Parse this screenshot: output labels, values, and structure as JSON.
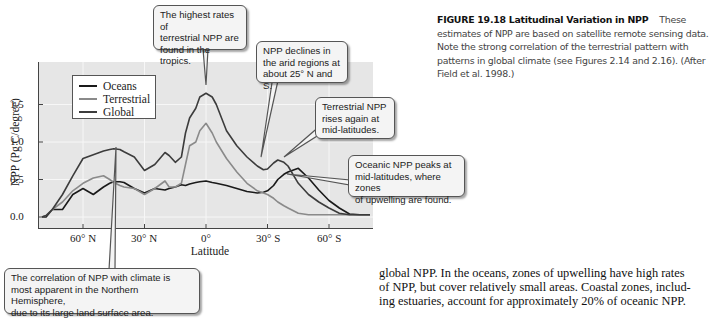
{
  "chart_data": {
    "type": "line",
    "title": "",
    "xlabel": "Latitude",
    "ylabel": "NPP (Pg C/degree)",
    "ylim": [
      -0.2,
      1.95
    ],
    "xlim": [
      80,
      -80
    ],
    "grid": true,
    "legend_position": "upper-left",
    "x_tick_labels": [
      "60° N",
      "30° N",
      "0°",
      "30° S",
      "60° S"
    ],
    "x_tick_values": [
      60,
      30,
      0,
      -30,
      -60
    ],
    "y_tick_labels": [
      "0.0",
      "0.5",
      "1.0",
      "1.5"
    ],
    "y_tick_values": [
      0.0,
      0.5,
      1.0,
      1.5
    ],
    "x": [
      80,
      78,
      75,
      70,
      65,
      60,
      55,
      50,
      47,
      45,
      42,
      40,
      35,
      30,
      25,
      20,
      18,
      15,
      12,
      10,
      8,
      5,
      3,
      0,
      -3,
      -5,
      -10,
      -15,
      -20,
      -25,
      -28,
      -30,
      -33,
      -35,
      -38,
      -40,
      -45,
      -50,
      -55,
      -60,
      -65,
      -70,
      -75,
      -80
    ],
    "series": [
      {
        "name": "Oceans",
        "color": "#1a1a1a",
        "values": [
          0.0,
          0.0,
          0.1,
          0.1,
          0.3,
          0.38,
          0.3,
          0.4,
          0.45,
          0.47,
          0.47,
          0.46,
          0.38,
          0.32,
          0.38,
          0.36,
          0.38,
          0.4,
          0.43,
          0.42,
          0.44,
          0.46,
          0.47,
          0.48,
          0.46,
          0.45,
          0.42,
          0.38,
          0.34,
          0.32,
          0.33,
          0.35,
          0.42,
          0.5,
          0.57,
          0.6,
          0.65,
          0.52,
          0.36,
          0.22,
          0.12,
          0.04,
          0.03,
          0.03
        ]
      },
      {
        "name": "Terrestrial",
        "color": "#8a8a8a",
        "values": [
          0.0,
          0.02,
          0.1,
          0.2,
          0.35,
          0.45,
          0.52,
          0.55,
          0.5,
          0.46,
          0.42,
          0.4,
          0.38,
          0.3,
          0.38,
          0.48,
          0.4,
          0.4,
          0.45,
          0.7,
          0.95,
          1.0,
          1.15,
          1.25,
          1.12,
          1.0,
          0.78,
          0.6,
          0.45,
          0.35,
          0.32,
          0.3,
          0.25,
          0.2,
          0.15,
          0.12,
          0.05,
          0.03,
          0.03,
          0.03,
          0.03,
          0.03,
          0.03,
          0.03
        ]
      },
      {
        "name": "Global",
        "color": "#3c3c3c",
        "values": [
          0.0,
          0.02,
          0.1,
          0.3,
          0.55,
          0.78,
          0.83,
          0.88,
          0.9,
          0.91,
          0.9,
          0.87,
          0.8,
          0.62,
          0.7,
          0.86,
          0.82,
          0.73,
          0.8,
          1.12,
          1.32,
          1.45,
          1.6,
          1.65,
          1.6,
          1.5,
          1.15,
          0.95,
          0.8,
          0.68,
          0.63,
          0.64,
          0.72,
          0.76,
          0.73,
          0.68,
          0.45,
          0.3,
          0.2,
          0.12,
          0.05,
          0.03,
          0.03,
          0.03
        ]
      }
    ],
    "annotations": [
      "The highest rates of terrestrial NPP are found in the tropics.",
      "NPP declines in the arid regions at about 25° N and S.",
      "Terrestrial NPP rises again at mid-latitudes.",
      "Oceanic NPP peaks at mid-latitudes, where zones of upwelling are found.",
      "The correlation of NPP with climate is most apparent in the Northern Hemisphere, due to its large land surface area."
    ]
  },
  "legend": {
    "items": [
      {
        "label": "Oceans",
        "color": "#1a1a1a"
      },
      {
        "label": "Terrestrial",
        "color": "#8a8a8a"
      },
      {
        "label": "Global",
        "color": "#3c3c3c"
      }
    ]
  },
  "axes": {
    "ylabel": "NPP (Pg C/degree)",
    "xlabel": "Latitude",
    "y_ticks": [
      "0.0",
      "0.5",
      "1.0",
      "1.5"
    ],
    "x_ticks": [
      "60° N",
      "30° N",
      "0°",
      "30° S",
      "60° S"
    ]
  },
  "callouts": {
    "tropics": [
      "The highest rates of",
      "terrestrial NPP are",
      "found in the tropics."
    ],
    "arid": [
      "NPP declines in",
      "the arid regions at",
      "about 25° N and S."
    ],
    "midlat_terrestrial": [
      "Terrestrial NPP",
      "rises again at",
      "mid-latitudes."
    ],
    "oceanic": [
      "Oceanic NPP peaks at",
      "mid-latitudes, where zones",
      "of upwelling are found."
    ],
    "northern": [
      "The correlation of NPP with climate is",
      "most apparent in the Northern Hemisphere,",
      "due to its large land surface area."
    ]
  },
  "caption": {
    "heading": "FIGURE 19.18  Latitudinal Variation in NPP",
    "text": "These estimates of NPP are based on satellite remote sensing data. Note the strong correlation of the terrestrial pattern with patterns in global climate (see Figures 2.14 and 2.16). (After Field et al. 1998.)"
  },
  "body_text": {
    "lines": [
      "global NPP. In the oceans, zones of upwelling have high rates",
      "of NPP, but cover relatively small areas. Coastal zones, includ-",
      "ing estuaries, account for approximately 20% of oceanic NPP."
    ]
  },
  "colors": {
    "plot_background": "#e6e6e6",
    "gridline": "#f7f7f7",
    "callout_background": "#f4f4f4",
    "callout_border": "#555555"
  }
}
